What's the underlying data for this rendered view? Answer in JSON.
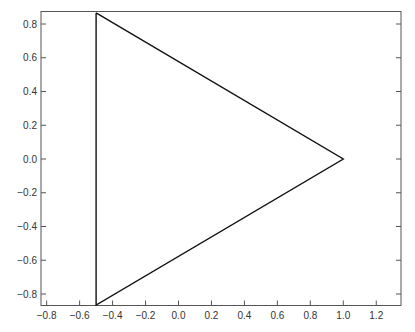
{
  "chart_data": {
    "type": "line",
    "title": "",
    "xlabel": "",
    "ylabel": "",
    "xlim": [
      -0.834,
      1.35
    ],
    "ylim": [
      -0.866,
      0.874
    ],
    "grid": false,
    "legend": null,
    "x_ticks": [
      -0.8,
      -0.6,
      -0.4,
      -0.2,
      0.0,
      0.2,
      0.4,
      0.6,
      0.8,
      1.0,
      1.2
    ],
    "x_tick_labels": [
      "−0.8",
      "−0.6",
      "−0.4",
      "−0.2",
      "0.0",
      "0.2",
      "0.4",
      "0.6",
      "0.8",
      "1.0",
      "1.2"
    ],
    "y_ticks": [
      -0.8,
      -0.6,
      -0.4,
      -0.2,
      0.0,
      0.2,
      0.4,
      0.6,
      0.8
    ],
    "y_tick_labels": [
      "−0.8",
      "−0.6",
      "−0.4",
      "−0.2",
      "0.0",
      "0.2",
      "0.4",
      "0.6",
      "0.8"
    ],
    "series": [
      {
        "name": "triangle",
        "color": "#111111",
        "closed": true,
        "x": [
          -0.5,
          1.0,
          -0.5,
          -0.5
        ],
        "y": [
          0.866,
          0.0,
          -0.866,
          0.866
        ]
      }
    ]
  },
  "layout": {
    "plot_left": 41,
    "plot_right": 401,
    "plot_top": 11.5,
    "plot_bottom": 305.5,
    "x_zero_px": 178.5,
    "x_px_per_unit": 164.8,
    "y_zero_px": 159,
    "y_px_per_unit": 168.75
  }
}
